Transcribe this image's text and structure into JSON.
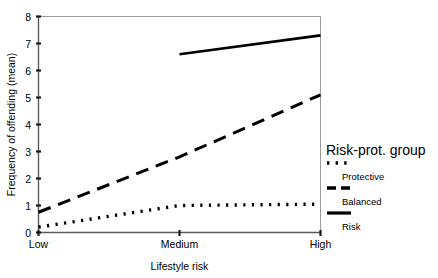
{
  "chart_data": {
    "type": "line",
    "title": "",
    "subtitle": "",
    "xlabel": "Lifestyle risk",
    "ylabel": "Frequency of offending (mean)",
    "x": [
      "Low",
      "Medium",
      "High"
    ],
    "categories": [
      "Low",
      "Medium",
      "High"
    ],
    "xtick_labels": [
      "Low",
      "Medium",
      "High"
    ],
    "ytick_labels": [
      "0",
      "1",
      "2",
      "3",
      "4",
      "5",
      "6",
      "7",
      "8"
    ],
    "ytick_values": [
      0,
      1,
      2,
      3,
      4,
      5,
      6,
      7,
      8
    ],
    "ylim": [
      0,
      8
    ],
    "grid": false,
    "legend_position": "right",
    "legend_title": "Risk-prot. group",
    "series": [
      {
        "name": "Protective",
        "style": "dotted",
        "color": "#000000",
        "values": [
          0.2,
          1.0,
          1.05
        ]
      },
      {
        "name": "Balanced",
        "style": "dashed",
        "color": "#000000",
        "values": [
          0.75,
          2.8,
          5.1
        ]
      },
      {
        "name": "Risk",
        "style": "solid",
        "color": "#000000",
        "values": [
          null,
          6.6,
          7.3
        ]
      }
    ],
    "annotations": []
  },
  "axes": {
    "y": {
      "label": "Frequency of offending (mean)",
      "ticks": [
        "8",
        "7",
        "6",
        "5",
        "4",
        "3",
        "2",
        "1",
        "0"
      ]
    },
    "x": {
      "label": "Lifestyle risk",
      "ticks": [
        "Low",
        "Medium",
        "High"
      ]
    }
  },
  "legend": {
    "title": "Risk-prot. group",
    "entries": [
      {
        "label": "Protective",
        "sample": "dotted-line-sample"
      },
      {
        "label": "Balanced",
        "sample": "dashed-line-sample"
      },
      {
        "label": "Risk",
        "sample": "solid-line-sample"
      }
    ]
  },
  "colors": {
    "ink": "#000000",
    "axis": "#5a5a5a",
    "frame": "#9a9a9a",
    "background": "#ffffff"
  }
}
